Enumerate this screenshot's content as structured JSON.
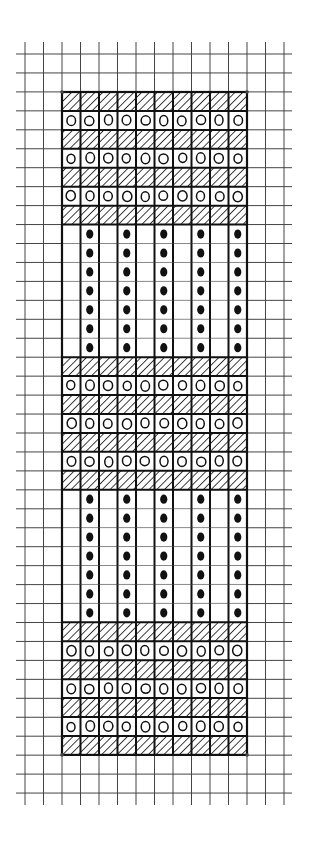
{
  "diagram": {
    "type": "stitch-chart",
    "canvas": {
      "width": 310,
      "height": 847,
      "background": "#ffffff"
    },
    "colors": {
      "ink": "#111111",
      "grid": "#444444",
      "faint": "#888888"
    },
    "grid": {
      "x_lines": [
        25,
        43.5,
        62,
        80.5,
        99,
        117.5,
        136,
        154.5,
        173,
        191.5,
        210,
        228.5,
        247,
        265.5,
        284
      ],
      "y_start": 54,
      "row_height": 18.95,
      "y_count": 40,
      "h_extent": [
        16,
        292
      ],
      "v_extent": [
        42,
        805
      ]
    },
    "pattern": {
      "x": 62,
      "y": 92,
      "cols": 10,
      "rows": 35,
      "cell_w": 18.5,
      "cell_h": 18.94,
      "legend": {
        "hatch": "diagonal hatched cell",
        "circle": "open circle cell",
        "dot": "filled dot in vertical column",
        "blank": "empty cell"
      },
      "row_types": [
        "hatch",
        "circle",
        "hatch",
        "circle",
        "hatch",
        "circle",
        "hatch",
        "dots",
        "dots",
        "dots",
        "dots",
        "dots",
        "dots",
        "dots",
        "hatch",
        "circle",
        "hatch",
        "circle",
        "hatch",
        "circle",
        "hatch",
        "dots",
        "dots",
        "dots",
        "dots",
        "dots",
        "dots",
        "dots",
        "hatch",
        "circle",
        "hatch",
        "circle",
        "hatch",
        "circle",
        "hatch"
      ],
      "dot_columns": [
        1,
        3,
        5,
        7,
        9
      ],
      "dot_sections": [
        [
          7,
          13
        ],
        [
          21,
          27
        ]
      ]
    }
  }
}
